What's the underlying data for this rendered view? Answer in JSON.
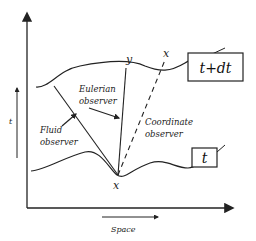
{
  "diagram": {
    "axes": {
      "time_label": "t",
      "space_label": "Space"
    },
    "surfaces": {
      "upper_label": "t+dt",
      "lower_label": "t"
    },
    "points": {
      "origin": "x",
      "eulerian_end": "y",
      "coordinate_end": "x"
    },
    "observers": {
      "eulerian": [
        "Eulerian",
        "observer"
      ],
      "fluid": [
        "Fluid",
        "observer"
      ],
      "coordinate": [
        "Coordinate",
        "observer"
      ]
    },
    "colors": {
      "ink": "#222222",
      "background": "#ffffff"
    }
  }
}
